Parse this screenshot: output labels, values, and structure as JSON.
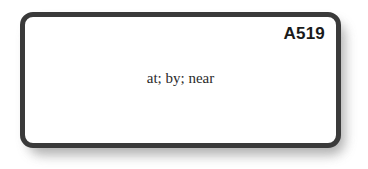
{
  "card": {
    "id_label": "A519",
    "body_text": "at; by; near",
    "border_color": "#3a3a3a",
    "face_color": "#ffffff",
    "shadow_color": "#9a9a9a",
    "text_color": "#2a2a2a",
    "id_color": "#1a1a1a"
  },
  "canvas": {
    "background_color": "#ffffff"
  }
}
